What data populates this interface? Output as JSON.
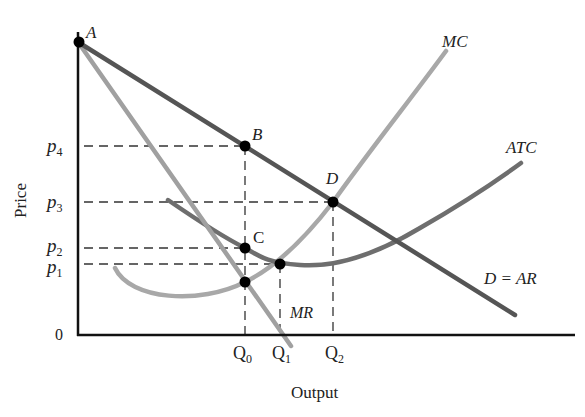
{
  "axes": {
    "ylabel": "Price",
    "xlabel": "Output",
    "origin": "0"
  },
  "price_ticks": [
    {
      "label": "p",
      "sub": "4"
    },
    {
      "label": "p",
      "sub": "3"
    },
    {
      "label": "p",
      "sub": "2"
    },
    {
      "label": "p",
      "sub": "1"
    }
  ],
  "quantity_ticks": [
    {
      "label": "Q",
      "sub": "0"
    },
    {
      "label": "Q",
      "sub": "1"
    },
    {
      "label": "Q",
      "sub": "2"
    }
  ],
  "curves": {
    "mc": "MC",
    "atc": "ATC",
    "demand": "D = AR",
    "mr": "MR"
  },
  "points": {
    "a": "A",
    "b": "B",
    "c": "C",
    "d": "D"
  },
  "colors": {
    "demand": "#555555",
    "atc": "#6e6e6e",
    "mc": "#a8a8a8",
    "mr": "#a0a0a0",
    "axis": "#111111",
    "dash": "#333333"
  }
}
